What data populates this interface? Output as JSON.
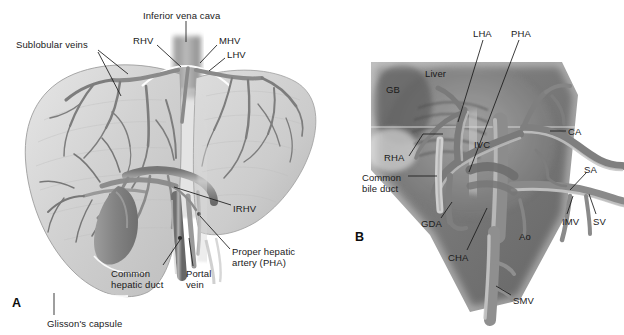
{
  "figure": {
    "type": "anatomical-illustration",
    "background_color": "#ffffff",
    "text_color": "#1a1a1a",
    "leader_line_color": "#1a1a1a",
    "panels": [
      {
        "id": "A",
        "name": "liver-hepatic-venous-anatomy",
        "id_label": "A",
        "id_pos": [
          12,
          296
        ],
        "palette": {
          "organ_fill_light": "#dcdcdc",
          "organ_fill_mid": "#c4c4c4",
          "organ_edge": "#9a9a9a",
          "vessel_dark": "#6f6f6f",
          "vessel_mid": "#8b8b8b",
          "vessel_light": "#b5b5b5",
          "gallbladder": "#8e8e8e",
          "ivc_trunk": "#a8a8a8"
        },
        "labels": [
          {
            "name": "inferior-vena-cava",
            "text": "Inferior vena cava",
            "x": 143,
            "y": 10,
            "leader": [
              [
                186,
                21
              ],
              [
                186,
                40
              ]
            ]
          },
          {
            "name": "rhv",
            "text": "RHV",
            "x": 133,
            "y": 35,
            "leader": [
              [
                157,
                45
              ],
              [
                180,
                66
              ]
            ]
          },
          {
            "name": "mhv",
            "text": "MHV",
            "x": 219,
            "y": 35,
            "leader": [
              [
                217,
                45
              ],
              [
                200,
                62
              ]
            ]
          },
          {
            "name": "lhv",
            "text": "LHV",
            "x": 227,
            "y": 49,
            "leader": [
              [
                225,
                58
              ],
              [
                210,
                70
              ]
            ]
          },
          {
            "name": "sublobular-veins",
            "text": "Sublobular veins",
            "x": 16,
            "y": 39,
            "leader": [
              [
                97,
                50
              ],
              [
                127,
                73
              ]
            ],
            "leader2": [
              [
                97,
                52
              ],
              [
                120,
                95
              ]
            ]
          },
          {
            "name": "irhv",
            "text": "IRHV",
            "x": 233,
            "y": 203,
            "leader": [
              [
                231,
                205
              ],
              [
                172,
                186
              ]
            ]
          },
          {
            "name": "proper-hepatic-artery",
            "text": "Proper hepatic\nartery (PHA)",
            "x": 232,
            "y": 246,
            "leader": [
              [
                230,
                250
              ],
              [
                199,
                215
              ]
            ]
          },
          {
            "name": "portal-vein",
            "text": "Portal\nvein",
            "x": 186,
            "y": 268,
            "leader": [
              [
                192,
                266
              ],
              [
                188,
                236
              ]
            ]
          },
          {
            "name": "common-hepatic-duct",
            "text": "Common\nhepatic duct",
            "x": 111,
            "y": 268,
            "leader": [
              [
                163,
                266
              ],
              [
                180,
                240
              ]
            ]
          },
          {
            "name": "glissons-capsule",
            "text": "Glisson's capsule",
            "x": 47,
            "y": 318,
            "leader": [
              [
                54,
                316
              ],
              [
                54,
                293
              ]
            ]
          }
        ]
      },
      {
        "id": "B",
        "name": "celiac-portal-arterial-anatomy",
        "id_label": "B",
        "id_pos": [
          355,
          230
        ],
        "palette": {
          "field_dark": "#6a6a6a",
          "field_mid": "#8e8e8e",
          "field_light": "#b0b0b0",
          "vessel_dark": "#5e5e5e",
          "vessel_mid": "#8a8a8a",
          "vessel_light": "#bcbcbc",
          "vessel_highlight": "#d8d8d8"
        },
        "labels": [
          {
            "name": "lha",
            "text": "LHA",
            "x": 473,
            "y": 28,
            "leader": [
              [
                483,
                39
              ],
              [
                458,
                120
              ]
            ]
          },
          {
            "name": "pha",
            "text": "PHA",
            "x": 511,
            "y": 28,
            "leader": [
              [
                518,
                39
              ],
              [
                470,
                170
              ]
            ]
          },
          {
            "name": "liver",
            "text": "Liver",
            "x": 425,
            "y": 68
          },
          {
            "name": "gb",
            "text": "GB",
            "x": 386,
            "y": 84
          },
          {
            "name": "ivc",
            "text": "IVC",
            "x": 474,
            "y": 139
          },
          {
            "name": "ca",
            "text": "CA",
            "x": 568,
            "y": 126,
            "leader": [
              [
                566,
                131
              ],
              [
                549,
                131
              ]
            ]
          },
          {
            "name": "sa",
            "text": "SA",
            "x": 584,
            "y": 164,
            "leader": [
              [
                586,
                173
              ],
              [
                571,
                190
              ]
            ]
          },
          {
            "name": "rha",
            "text": "RHA",
            "x": 384,
            "y": 152,
            "leader": [
              [
                408,
                156
              ],
              [
                426,
                133
              ]
            ]
          },
          {
            "name": "common-bile-duct",
            "text": "Common\nbile duct",
            "x": 362,
            "y": 172,
            "leader": [
              [
                409,
                176
              ],
              [
                432,
                176
              ]
            ]
          },
          {
            "name": "gda",
            "text": "GDA",
            "x": 421,
            "y": 218,
            "leader": [
              [
                440,
                218
              ],
              [
                452,
                202
              ]
            ]
          },
          {
            "name": "imv",
            "text": "IMV",
            "x": 562,
            "y": 216,
            "leader": [
              [
                567,
                215
              ],
              [
                574,
                195
              ]
            ]
          },
          {
            "name": "sv",
            "text": "SV",
            "x": 593,
            "y": 216,
            "leader": [
              [
                595,
                215
              ],
              [
                588,
                192
              ]
            ]
          },
          {
            "name": "ao",
            "text": "Ao",
            "x": 519,
            "y": 231
          },
          {
            "name": "cha",
            "text": "CHA",
            "x": 448,
            "y": 252,
            "leader": [
              [
                466,
                250
              ],
              [
                486,
                208
              ]
            ]
          },
          {
            "name": "smv",
            "text": "SMV",
            "x": 513,
            "y": 295,
            "leader": [
              [
                511,
                296
              ],
              [
                497,
                287
              ]
            ]
          }
        ]
      }
    ]
  }
}
